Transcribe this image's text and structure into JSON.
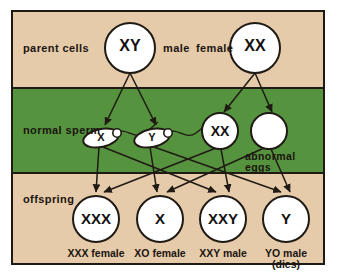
{
  "diagram": {
    "colors": {
      "background": "#e6cbaa",
      "band": "#55933e",
      "border": "#201a14",
      "cell_fill": "#ffffff",
      "ink": "#151010"
    },
    "row_labels": {
      "parent": "parent cells",
      "sperm": "normal sperm",
      "offspring": "offspring"
    },
    "sex_labels": {
      "male": "male",
      "female": "female"
    },
    "abnormal_label_line1": "abnormal",
    "abnormal_label_line2": "eggs",
    "parent_cells": [
      {
        "id": "father",
        "genotype": "XY",
        "sex": "male",
        "cx": 130,
        "cy": 48,
        "r": 25
      },
      {
        "id": "mother",
        "genotype": "XX",
        "sex": "female",
        "cx": 255,
        "cy": 48,
        "r": 25
      }
    ],
    "gametes": {
      "sperm": [
        {
          "id": "sperm-x",
          "genotype": "X",
          "cx": 101,
          "cy": 138
        },
        {
          "id": "sperm-y",
          "genotype": "Y",
          "cx": 152,
          "cy": 138
        }
      ],
      "eggs": [
        {
          "id": "egg-xx",
          "genotype": "XX",
          "cx": 220,
          "cy": 131,
          "r": 18
        },
        {
          "id": "egg-o",
          "genotype": "",
          "cx": 269,
          "cy": 131,
          "r": 18
        }
      ]
    },
    "offspring": [
      {
        "id": "offspring-xxx",
        "genotype": "XXX",
        "caption": "XXX female",
        "caption2": "",
        "cx": 96,
        "cy": 219,
        "r": 23
      },
      {
        "id": "offspring-x",
        "genotype": "X",
        "caption": "XO female",
        "caption2": "",
        "cx": 160,
        "cy": 219,
        "r": 23
      },
      {
        "id": "offspring-xxy",
        "genotype": "XXY",
        "caption": "XXY male",
        "caption2": "",
        "cx": 223,
        "cy": 219,
        "r": 23
      },
      {
        "id": "offspring-y",
        "genotype": "Y",
        "caption": "YO male",
        "caption2": "(dies)",
        "cx": 286,
        "cy": 219,
        "r": 23
      }
    ]
  }
}
